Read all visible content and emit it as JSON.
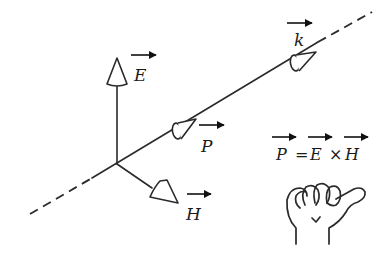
{
  "diagram": {
    "vectors": [
      {
        "id": "E",
        "label": "E",
        "direction": "up"
      },
      {
        "id": "H",
        "label": "H",
        "direction": "down-right"
      },
      {
        "id": "P",
        "label": "P",
        "direction": "along propagation line"
      },
      {
        "id": "k",
        "label": "k",
        "direction": "along propagation line"
      }
    ],
    "equation": {
      "lhs": "P",
      "equals": "=",
      "op1": "E",
      "cross": "×",
      "op2": "H"
    },
    "hand_icon": "right-hand-thumb-up",
    "colors": {
      "stroke": "#2a2a2a",
      "background": "#ffffff"
    }
  }
}
